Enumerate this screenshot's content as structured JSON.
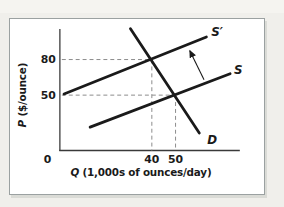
{
  "figure": {
    "background_color": "#f0efeb",
    "panel_color": "#ffffff",
    "panel_border_color": "#9ba1a1"
  },
  "chart_data": {
    "type": "line",
    "title": "",
    "xlabel": "Q (1,000s of ounces/day)",
    "ylabel": "P ($/ounce)",
    "origin_label": "0",
    "x_ticks": [
      40,
      50
    ],
    "y_ticks": [
      80,
      50
    ],
    "axis_color": "#3a3a3a",
    "line_color": "#1a1a1a",
    "dash_color": "#8c8c8c",
    "series": [
      {
        "name": "S",
        "kind": "supply",
        "points": [
          [
            14,
            23
          ],
          [
            73,
            68
          ]
        ]
      },
      {
        "name": "S′",
        "kind": "supply-shifted",
        "points": [
          [
            3,
            51
          ],
          [
            63,
            99
          ]
        ]
      },
      {
        "name": "D",
        "kind": "demand",
        "points": [
          [
            31,
            106
          ],
          [
            60,
            18
          ]
        ]
      }
    ],
    "equilibria": [
      {
        "q": 40,
        "p": 80,
        "note": "intersection of S′ and D"
      },
      {
        "q": 50,
        "p": 50,
        "note": "intersection of S and D"
      }
    ],
    "shift_arrow": {
      "from_qp": [
        62,
        63
      ],
      "to_qp": [
        56,
        87.5
      ],
      "meaning": "shift from S to S′"
    }
  }
}
